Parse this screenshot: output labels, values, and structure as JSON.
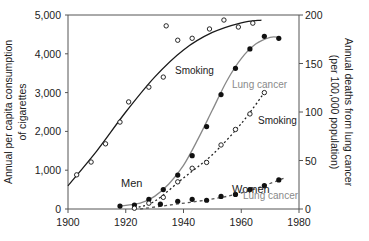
{
  "chart_data": {
    "type": "line",
    "title": "",
    "xlabel": "",
    "ylabel_left": "Annual per capita consumption of cigarettes",
    "ylabel_right": "Annual deaths from lung cancer (per 100,000 population)",
    "xlim": [
      1900,
      1980
    ],
    "ylim_left": [
      0,
      5000
    ],
    "ylim_right": [
      0,
      200
    ],
    "x_ticks": [
      "1900",
      "1920",
      "1940",
      "1960",
      "1980"
    ],
    "y_ticks_left": [
      "0",
      "1,000",
      "2,000",
      "3,000",
      "4,000",
      "5,000"
    ],
    "y_ticks_right": [
      "0",
      "50",
      "100",
      "150",
      "200"
    ],
    "grid": false,
    "annotations": [
      "Men",
      "Women",
      "Smoking",
      "Lung cancer",
      "Smoking",
      "Lung cancer"
    ],
    "series": [
      {
        "name": "Men – Smoking",
        "axis": "left",
        "marker": "open-circle",
        "line": "solid",
        "label": "Smoking",
        "points": [
          [
            1903,
            880
          ],
          [
            1908,
            1210
          ],
          [
            1913,
            1680
          ],
          [
            1918,
            2240
          ],
          [
            1921,
            2760
          ],
          [
            1928,
            3140
          ],
          [
            1933,
            3400
          ],
          [
            1934,
            4720
          ],
          [
            1938,
            4350
          ],
          [
            1943,
            4400
          ],
          [
            1949,
            4640
          ],
          [
            1954,
            4870
          ],
          [
            1959,
            4690
          ],
          [
            1964,
            4790
          ]
        ],
        "fit": [
          [
            1900,
            600
          ],
          [
            1910,
            1500
          ],
          [
            1920,
            2500
          ],
          [
            1930,
            3400
          ],
          [
            1940,
            4100
          ],
          [
            1950,
            4550
          ],
          [
            1960,
            4800
          ],
          [
            1967,
            4870
          ]
        ]
      },
      {
        "name": "Men – Lung cancer",
        "axis": "right",
        "marker": "filled-circle",
        "line": "solid-gray",
        "label": "Lung cancer",
        "points": [
          [
            1918,
            3
          ],
          [
            1923,
            4
          ],
          [
            1928,
            10
          ],
          [
            1933,
            20
          ],
          [
            1938,
            35
          ],
          [
            1943,
            55
          ],
          [
            1948,
            85
          ],
          [
            1953,
            118
          ],
          [
            1958,
            145
          ],
          [
            1963,
            165
          ],
          [
            1968,
            178
          ],
          [
            1973,
            176
          ]
        ],
        "fit": [
          [
            1918,
            3
          ],
          [
            1925,
            6
          ],
          [
            1930,
            13
          ],
          [
            1935,
            26
          ],
          [
            1940,
            45
          ],
          [
            1945,
            72
          ],
          [
            1950,
            102
          ],
          [
            1955,
            132
          ],
          [
            1960,
            155
          ],
          [
            1965,
            170
          ],
          [
            1970,
            177
          ],
          [
            1973,
            177
          ]
        ]
      },
      {
        "name": "Women – Smoking",
        "axis": "left",
        "marker": "open-circle",
        "line": "dotted",
        "label": "Smoking",
        "points": [
          [
            1923,
            20
          ],
          [
            1928,
            150
          ],
          [
            1933,
            300
          ],
          [
            1938,
            700
          ],
          [
            1943,
            1050
          ],
          [
            1948,
            1200
          ],
          [
            1953,
            1650
          ],
          [
            1958,
            2050
          ],
          [
            1963,
            2450
          ],
          [
            1968,
            3000
          ]
        ],
        "fit": [
          [
            1923,
            20
          ],
          [
            1930,
            200
          ],
          [
            1940,
            800
          ],
          [
            1950,
            1400
          ],
          [
            1960,
            2200
          ],
          [
            1968,
            3000
          ]
        ]
      },
      {
        "name": "Women – Lung cancer",
        "axis": "right",
        "marker": "filled-circle",
        "line": "dashed",
        "label": "Lung cancer",
        "points": [
          [
            1932,
            5
          ],
          [
            1938,
            8
          ],
          [
            1943,
            10
          ],
          [
            1948,
            9
          ],
          [
            1953,
            13
          ],
          [
            1958,
            15
          ],
          [
            1963,
            20
          ],
          [
            1968,
            24
          ],
          [
            1973,
            30
          ]
        ],
        "fit": [
          [
            1925,
            0
          ],
          [
            1935,
            4
          ],
          [
            1945,
            8
          ],
          [
            1955,
            13
          ],
          [
            1965,
            21
          ],
          [
            1975,
            32
          ]
        ]
      }
    ]
  },
  "labels": {
    "men": "Men",
    "women": "Women",
    "men_smoking": "Smoking",
    "men_lung": "Lung cancer",
    "women_smoking": "Smoking",
    "women_lung": "Lung cancer",
    "ylabel_left_1": "Annual per capita consumption",
    "ylabel_left_2": "of cigarettes",
    "ylabel_right_1": "Annual deaths from lung cancer",
    "ylabel_right_2": "(per 100,000 population)"
  },
  "colors": {
    "axis": "#555555",
    "men_smoking_line": "#1a1a1a",
    "lung_line": "#888888",
    "marker": "#111111",
    "lung_label": "#8a8a8a",
    "text": "#222222"
  }
}
